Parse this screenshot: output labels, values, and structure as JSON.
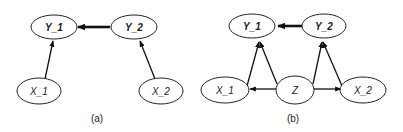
{
  "panels": [
    {
      "caption": "(a)",
      "nodes": [
        {
          "id": "Y_1",
          "label": "Y_1"
        },
        {
          "id": "Y_2",
          "label": "Y_2"
        },
        {
          "id": "X_1",
          "label": "X_1"
        },
        {
          "id": "X_2",
          "label": "X_2"
        }
      ],
      "edges": [
        {
          "from": "Y_2",
          "to": "Y_1",
          "style": "thick"
        },
        {
          "from": "X_1",
          "to": "Y_1"
        },
        {
          "from": "X_2",
          "to": "Y_2"
        }
      ]
    },
    {
      "caption": "(b)",
      "nodes": [
        {
          "id": "Y_1",
          "label": "Y_1"
        },
        {
          "id": "Y_2",
          "label": "Y_2"
        },
        {
          "id": "X_1",
          "label": "X_1"
        },
        {
          "id": "Z",
          "label": "Z"
        },
        {
          "id": "X_2",
          "label": "X_2"
        }
      ],
      "edges": [
        {
          "from": "Y_2",
          "to": "Y_1",
          "style": "thick"
        },
        {
          "from": "X_1",
          "to": "Y_1"
        },
        {
          "from": "Z",
          "to": "Y_1"
        },
        {
          "from": "Z",
          "to": "Y_2"
        },
        {
          "from": "X_2",
          "to": "Y_2"
        },
        {
          "from": "Z",
          "to": "X_1"
        },
        {
          "from": "Z",
          "to": "X_2"
        }
      ]
    }
  ]
}
